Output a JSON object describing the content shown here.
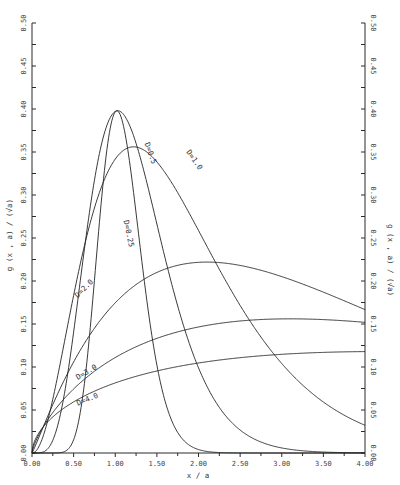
{
  "chart_data": {
    "type": "line",
    "title": "",
    "xlabel": "x / a",
    "ylabel": "g (x , a) / (√a)",
    "ylabel_right": "g (x , a) / (√a)",
    "xlim": [
      0.0,
      4.0
    ],
    "ylim": [
      0.0,
      0.5
    ],
    "grid": false,
    "legend": "inline curve labels",
    "x_ticks": [
      "0.00",
      "0.50",
      "1.00",
      "1.50",
      "2.00",
      "2.50",
      "3.00",
      "3.50",
      "4.00"
    ],
    "y_ticks": [
      "0.00",
      "0.05",
      "0.10",
      "0.15",
      "0.20",
      "0.25",
      "0.30",
      "0.35",
      "0.40",
      "0.45",
      "0.50"
    ],
    "series": [
      {
        "name": "D=0.25",
        "peak_x": 1.02,
        "peak_y": 0.398,
        "shape": 16,
        "x": [
          0.0,
          0.4,
          0.6,
          0.8,
          1.0,
          1.2,
          1.4,
          1.6,
          1.8,
          2.0
        ],
        "values": [
          0.0,
          0.01,
          0.08,
          0.28,
          0.397,
          0.3,
          0.14,
          0.05,
          0.01,
          0.0
        ]
      },
      {
        "name": "D=0.5",
        "peak_x": 1.03,
        "peak_y": 0.398,
        "shape": 5,
        "x": [
          0.0,
          0.5,
          0.8,
          1.0,
          1.2,
          1.5,
          2.0,
          2.5,
          3.0
        ],
        "values": [
          0.0,
          0.16,
          0.35,
          0.397,
          0.37,
          0.24,
          0.07,
          0.01,
          0.0
        ]
      },
      {
        "name": "D=1.0",
        "peak_x": 1.22,
        "peak_y": 0.356,
        "shape": 2.2,
        "x": [
          0.0,
          0.5,
          1.0,
          1.22,
          1.5,
          2.0,
          2.5,
          3.0,
          3.5,
          4.0
        ],
        "values": [
          0.0,
          0.22,
          0.345,
          0.356,
          0.34,
          0.26,
          0.16,
          0.09,
          0.045,
          0.02
        ]
      },
      {
        "name": "D=2.0",
        "peak_x": 2.1,
        "peak_y": 0.222,
        "shape": 1.1,
        "x": [
          0.0,
          0.5,
          1.0,
          1.5,
          2.1,
          2.5,
          3.0,
          3.5,
          4.0
        ],
        "values": [
          0.0,
          0.085,
          0.15,
          0.2,
          0.222,
          0.215,
          0.19,
          0.15,
          0.11
        ]
      },
      {
        "name": "D=3.0",
        "peak_x": 3.1,
        "peak_y": 0.156,
        "shape": 0.75,
        "x": [
          0.0,
          0.5,
          1.0,
          1.5,
          2.0,
          2.5,
          3.1,
          3.5,
          4.0
        ],
        "values": [
          0.0,
          0.05,
          0.085,
          0.11,
          0.13,
          0.147,
          0.156,
          0.152,
          0.141
        ]
      },
      {
        "name": "D=4.0",
        "peak_x": 4.2,
        "peak_y": 0.118,
        "shape": 0.55,
        "x": [
          0.0,
          0.5,
          1.0,
          1.5,
          2.0,
          2.5,
          3.0,
          3.5,
          4.0
        ],
        "values": [
          0.0,
          0.035,
          0.058,
          0.075,
          0.088,
          0.1,
          0.108,
          0.114,
          0.117
        ]
      }
    ],
    "annotations": [
      {
        "text": "D=0.25",
        "x": 1.1,
        "y": 0.27,
        "rotate": 78
      },
      {
        "text": "D=0.5",
        "x": 1.35,
        "y": 0.36,
        "rotate": 70
      },
      {
        "text": "D=1.0",
        "x": 1.85,
        "y": 0.35,
        "rotate": 55
      },
      {
        "text": "D=2.0",
        "x": 0.55,
        "y": 0.18,
        "rotate": -45
      },
      {
        "text": "D=3.0",
        "x": 0.55,
        "y": 0.085,
        "rotate": -30
      },
      {
        "text": "D=4.0",
        "x": 0.55,
        "y": 0.055,
        "rotate": -22
      }
    ]
  },
  "labels": {
    "xlabel": "x / a",
    "ylabel": "g (x , a) / (√a)"
  }
}
